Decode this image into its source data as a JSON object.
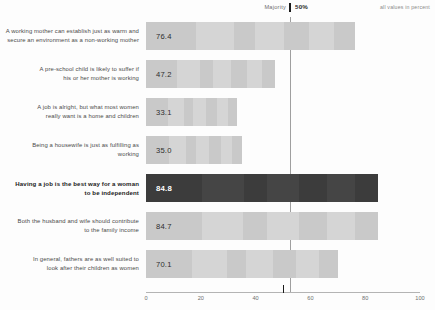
{
  "header": {
    "majority_label": "Majority",
    "majority_percent": "50%",
    "units_note": "all values in percent"
  },
  "chart_data": {
    "type": "bar",
    "orientation": "horizontal",
    "title": "",
    "subtitle": "",
    "xlabel": "",
    "ylabel": "",
    "xlim": [
      0,
      100
    ],
    "xticks": [
      "0",
      "20",
      "40",
      "60",
      "80",
      "100"
    ],
    "grid": false,
    "legend": null,
    "units": "percent",
    "reference_line": {
      "label": "Majority",
      "value": 50,
      "value_label": "50%"
    },
    "categories": [
      "A working mother can establish just as warm and secure an environment as a non-working mother",
      "A pre-school child is likely to suffer if his or her mother is working",
      "A job is alright, but what most women really want is a home and children",
      "Being a housewife is just as fulfilling as working",
      "Having a job is the best way for a woman to be independent",
      "Both the husband and wife should contribute to the family income",
      "In general, fathers are as well suited to look after their children as women"
    ],
    "values": [
      76.4,
      47.2,
      33.1,
      35.0,
      84.8,
      84.7,
      70.1
    ],
    "value_labels": [
      "76.4",
      "47.2",
      "33.1",
      "35.0",
      "84.8",
      "84.7",
      "70.1"
    ],
    "highlighted_index": 4,
    "colors": {
      "bar": "#c9c9c9",
      "bar_highlighted": "#3c3c3c",
      "value_text": "#2d2d2d",
      "value_text_highlighted": "#ffffff",
      "label_text": "#4a4a4a",
      "axis": "#b4b4b4",
      "reference_line": "#9f9f9f",
      "background": "#fdfdfd"
    },
    "rows": [
      {
        "label_line1": "A working mother can establish just as warm and",
        "label_line2": "secure an environment as a non-working mother",
        "value": 76.4,
        "value_label": "76.4",
        "highlighted": false
      },
      {
        "label_line1": "A pre-school child is likely to suffer if",
        "label_line2": "his or her mother is working",
        "value": 47.2,
        "value_label": "47.2",
        "highlighted": false
      },
      {
        "label_line1": "A job is alright, but what most women",
        "label_line2": "really want is a home and children",
        "value": 33.1,
        "value_label": "33.1",
        "highlighted": false
      },
      {
        "label_line1": "Being a housewife is just as fulfilling as",
        "label_line2": "working",
        "value": 35.0,
        "value_label": "35.0",
        "highlighted": false
      },
      {
        "label_line1": "Having a job is the best way for a woman",
        "label_line2": "to be independent",
        "value": 84.8,
        "value_label": "84.8",
        "highlighted": true
      },
      {
        "label_line1": "Both the husband and wife should contribute",
        "label_line2": "to the family income",
        "value": 84.7,
        "value_label": "84.7",
        "highlighted": false
      },
      {
        "label_line1": "In general, fathers are as well suited to",
        "label_line2": "look after their children as women",
        "value": 70.1,
        "value_label": "70.1",
        "highlighted": false
      }
    ]
  }
}
